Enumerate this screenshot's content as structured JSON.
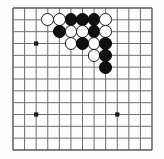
{
  "board": {
    "kind": "go-board-diagram",
    "description": "Go board corner position, grid of intersections with black and white stones",
    "grid": {
      "cols": 13,
      "rows": 13,
      "left": 13,
      "top": 8,
      "right": 152,
      "bottom": 150,
      "line_color": "#6e6e6e",
      "edge_color": "#555555",
      "line_width": 1,
      "edge_width": 1.4
    },
    "star_points": [
      {
        "col": 2,
        "row": 3
      },
      {
        "col": 2,
        "row": 9
      },
      {
        "col": 9,
        "row": 9
      }
    ],
    "star_point_color": "#1a1a1a",
    "star_point_radius": 2.1,
    "stone_radius": 6.4,
    "colors": {
      "black": "#101010",
      "white": "#ffffff",
      "white_outline": "#1a1a1a",
      "background": "#fdfdfd"
    },
    "stones": [
      {
        "col": 3,
        "row": 1,
        "color": "white"
      },
      {
        "col": 4,
        "row": 1,
        "color": "white"
      },
      {
        "col": 5,
        "row": 1,
        "color": "black"
      },
      {
        "col": 6,
        "row": 1,
        "color": "black"
      },
      {
        "col": 7,
        "row": 1,
        "color": "black"
      },
      {
        "col": 8,
        "row": 1,
        "color": "white"
      },
      {
        "col": 4,
        "row": 2,
        "color": "black"
      },
      {
        "col": 5,
        "row": 2,
        "color": "white"
      },
      {
        "col": 6,
        "row": 2,
        "color": "white"
      },
      {
        "col": 7,
        "row": 2,
        "color": "black"
      },
      {
        "col": 8,
        "row": 2,
        "color": "white"
      },
      {
        "col": 5,
        "row": 3,
        "color": "white"
      },
      {
        "col": 6,
        "row": 3,
        "color": "black"
      },
      {
        "col": 7,
        "row": 3,
        "color": "white"
      },
      {
        "col": 8,
        "row": 3,
        "color": "black"
      },
      {
        "col": 7,
        "row": 4,
        "color": "white"
      },
      {
        "col": 8,
        "row": 4,
        "color": "black"
      },
      {
        "col": 8,
        "row": 5,
        "color": "black"
      }
    ]
  }
}
